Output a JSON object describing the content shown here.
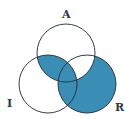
{
  "diagram": {
    "type": "venn",
    "labels": {
      "a": "A",
      "i": "I",
      "r": "R"
    },
    "fill_color": "#3a8db5",
    "stroke_color": "#1f2a36",
    "shaded_regions": [
      "A∩I only",
      "A∩I∩R",
      "I∩R only",
      "R only"
    ],
    "unshaded_regions": [
      "A only",
      "I only",
      "A∩R only"
    ]
  }
}
